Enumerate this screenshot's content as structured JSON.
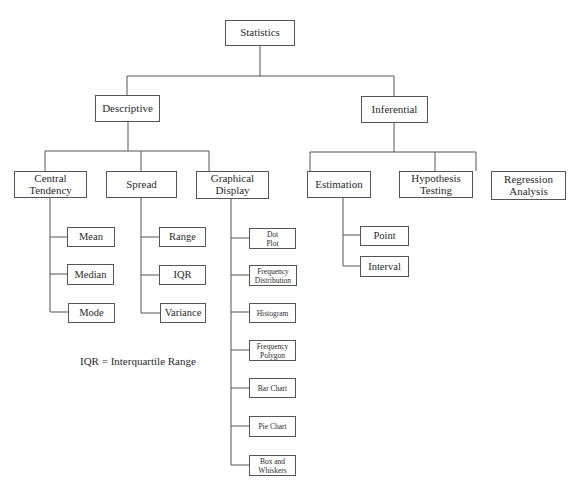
{
  "diagram": {
    "type": "hierarchy tree",
    "root": {
      "label": "Statistics",
      "children": [
        {
          "label": "Descriptive",
          "children": [
            {
              "label": "Central\nTendency",
              "children": [
                "Mean",
                "Median",
                "Mode"
              ]
            },
            {
              "label": "Spread",
              "children": [
                "Range",
                "IQR",
                "Variance"
              ]
            },
            {
              "label": "Graphical\nDisplay",
              "children": [
                "Dot\nPlot",
                "Frequency\nDistribution",
                "Histogram",
                "Frequency\nPolygon",
                "Bar Chart",
                "Pie Chart",
                "Box and\nWhiskers"
              ]
            }
          ]
        },
        {
          "label": "Inferential",
          "children": [
            {
              "label": "Estimation",
              "children": [
                "Point",
                "Interval"
              ]
            },
            {
              "label": "Hypothesis\nTesting",
              "children": []
            },
            {
              "label": "Regression\nAnalysis",
              "children": []
            }
          ]
        }
      ]
    },
    "note": "IQR = Interquartile Range"
  },
  "colors": {
    "line": "#555555",
    "text": "#2a2a2a",
    "background": "#ffffff"
  }
}
